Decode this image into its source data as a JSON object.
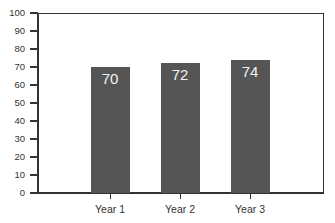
{
  "chart_data": {
    "type": "bar",
    "title": "",
    "xlabel": "",
    "ylabel": "",
    "categories": [
      "Year 1",
      "Year 2",
      "Year 3"
    ],
    "values": [
      70,
      72,
      74
    ],
    "data_labels": [
      "70",
      "72",
      "74"
    ],
    "ylim": [
      0,
      100
    ],
    "yticks": [
      0,
      10,
      20,
      30,
      40,
      50,
      60,
      70,
      80,
      90,
      100
    ],
    "ytick_labels": [
      "0",
      "10",
      "20",
      "30",
      "40",
      "50",
      "60",
      "70",
      "80",
      "90",
      "100"
    ],
    "grid": false,
    "legend": null,
    "bar_color": "#555555",
    "label_color": "#f2f2f2"
  },
  "colors": {
    "bar": "#555555",
    "axis": "#333333",
    "background": "#ffffff"
  }
}
